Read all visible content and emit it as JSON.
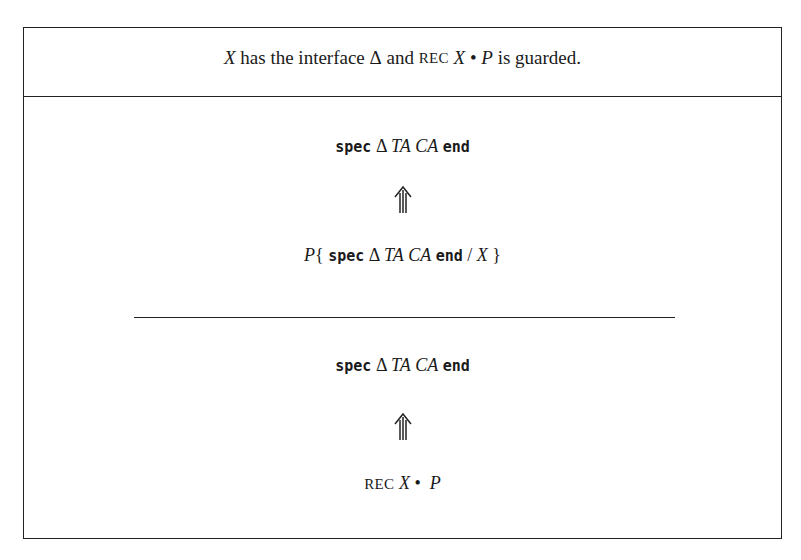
{
  "figure": {
    "side_condition": {
      "parts": [
        "X",
        " has the interface ",
        "Δ",
        " and ",
        "REC",
        " ",
        "X",
        " • ",
        "P",
        " is guarded."
      ]
    },
    "premise": {
      "upper": {
        "kw1": "spec",
        "delta": "Δ",
        "ta": "TA",
        "ca": "CA",
        "kw2": "end"
      },
      "arrow": "refines-arrow",
      "lower": {
        "p": "P",
        "open": "{",
        "kw1": "spec",
        "delta": "Δ",
        "ta": "TA",
        "ca": "CA",
        "kw2": "end",
        "slash": "/",
        "x": "X",
        "close": "}"
      }
    },
    "conclusion": {
      "upper": {
        "kw1": "spec",
        "delta": "Δ",
        "ta": "TA",
        "ca": "CA",
        "kw2": "end"
      },
      "arrow": "refines-arrow",
      "lower": {
        "rec": "REC",
        "x": "X",
        "dot": "•",
        "p": "P"
      }
    }
  }
}
